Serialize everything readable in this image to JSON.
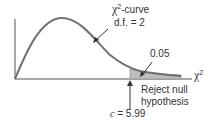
{
  "diagram": {
    "type": "chi-square distribution",
    "curve_label": {
      "symbol": "χ",
      "superscript": "2",
      "suffix": "-curve",
      "df_line": "d.f. = 2"
    },
    "tail_area_label": "0.05",
    "axis_label": {
      "symbol": "χ",
      "superscript": "2"
    },
    "reject_label_line1": "Reject null",
    "reject_label_line2": "hypothesis",
    "critical_value": {
      "variable": "c",
      "equals": " = 5.99"
    },
    "colors": {
      "curve": "#707070",
      "axis": "#555555",
      "shaded_region": "#bdbdbd",
      "text": "#333333"
    }
  }
}
